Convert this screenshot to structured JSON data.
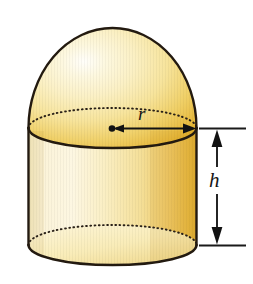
{
  "figure": {
    "background_color": "#ffffff",
    "shape": {
      "name": "hemisphere-on-cylinder",
      "parts": [
        {
          "name": "hemisphere-dome",
          "description": "hemispherical cap forming the top of the solid"
        },
        {
          "name": "cylinder-body",
          "description": "right circular cylinder forming the lower body"
        }
      ],
      "fill_light": "#fdf6d8",
      "fill_mid": "#f7e49a",
      "fill_dark": "#e8b93f",
      "fill_deep": "#d9a62c",
      "outline_color": "#231a10",
      "hidden_edge_style": "dotted"
    },
    "dimensions": [
      {
        "name": "radius",
        "symbol": "r",
        "annotation": "radius-arrow",
        "description": "arrow from the center of the top circle to its right edge",
        "arrow_style": "single-headed with center dot"
      },
      {
        "name": "height",
        "symbol": "h",
        "annotation": "height-arrow",
        "description": "double-headed vertical arrow spanning the cylinder height on the right side",
        "arrow_style": "double-headed between extension lines"
      }
    ],
    "colors": {
      "accent": "#e8b93f",
      "highlight": "#fdf6d8",
      "outline": "#231a10",
      "dimension_line": "#1a1a1a"
    }
  }
}
